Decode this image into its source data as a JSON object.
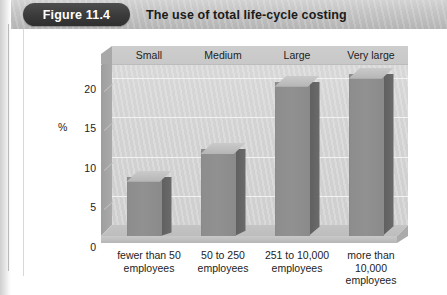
{
  "figure": {
    "badge_label": "Figure 11.4",
    "title": "The use of total life-cycle costing"
  },
  "chart_data": {
    "type": "bar",
    "title": "The use of total life-cycle costing",
    "xlabel": "",
    "ylabel": "%",
    "ylim": [
      0,
      23
    ],
    "yticks": [
      "0",
      "5",
      "10",
      "15",
      "20"
    ],
    "grid": true,
    "legend": "none",
    "style": "3d-column",
    "categories": [
      "fewer than 50 employees",
      "50 to 250 employees",
      "251 to 10,000 employees",
      "more than 10,000 employees"
    ],
    "category_headers": [
      "Small",
      "Medium",
      "Large",
      "Very large"
    ],
    "values": [
      7.5,
      11,
      19.5,
      20.5
    ],
    "series": [
      {
        "name": "Use of total life-cycle costing",
        "values": [
          7.5,
          11,
          19.5,
          20.5
        ]
      }
    ]
  },
  "axis": {
    "y_title": "%",
    "y_ticks": [
      {
        "label": "20",
        "value": 20
      },
      {
        "label": "15",
        "value": 15
      },
      {
        "label": "10",
        "value": 10
      },
      {
        "label": "5",
        "value": 5
      },
      {
        "label": "0",
        "value": 0
      }
    ]
  },
  "category_headers": [
    {
      "label": "Small"
    },
    {
      "label": "Medium"
    },
    {
      "label": "Large"
    },
    {
      "label": "Very large"
    }
  ],
  "x_labels": [
    {
      "line1": "fewer than 50",
      "line2": "employees",
      "line3": ""
    },
    {
      "line1": "50 to 250",
      "line2": "employees",
      "line3": ""
    },
    {
      "line1": "251 to 10,000",
      "line2": "employees",
      "line3": ""
    },
    {
      "line1": "more than",
      "line2": "10,000",
      "line3": "employees"
    }
  ],
  "colors": {
    "badge_bg": "#3a3a3a",
    "header_bg": "#c6c6c6",
    "bar_front": "#919191",
    "bar_side": "#656565",
    "bar_top": "#c0c0c0",
    "plot_bg": "#d4d4d4",
    "page_bg": "#ffffff"
  }
}
